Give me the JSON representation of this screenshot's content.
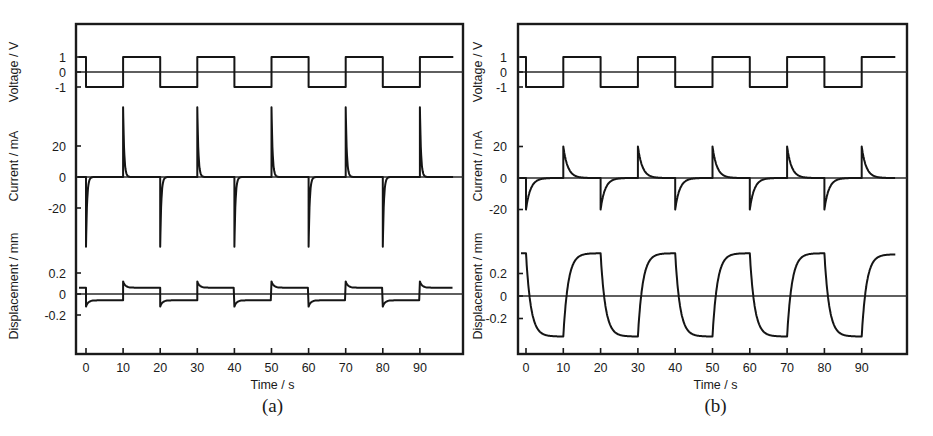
{
  "figure": {
    "panels": [
      {
        "id": "a",
        "caption": "(a)",
        "xlabel": "Time / s",
        "ylabels": [
          "Voltage / V",
          "Current / mA",
          "Displacement / mm"
        ],
        "voltage_ticks": [
          "1",
          "0",
          "-1"
        ],
        "current_ticks": [
          "20",
          "0",
          "-20"
        ],
        "displacement_ticks": [
          "0.2",
          "0",
          "-0.2"
        ],
        "x_ticks": [
          "0",
          "10",
          "20",
          "30",
          "40",
          "50",
          "60",
          "70",
          "80",
          "90"
        ]
      },
      {
        "id": "b",
        "caption": "(b)",
        "xlabel": "Time / s",
        "ylabels": [
          "Voltage / V",
          "Current / mA",
          "Displacement / mm"
        ],
        "voltage_ticks": [
          "1",
          "0",
          "-1"
        ],
        "current_ticks": [
          "20",
          "0",
          "-20"
        ],
        "displacement_ticks": [
          "0.2",
          "0",
          "-0.2"
        ],
        "x_ticks": [
          "0",
          "10",
          "20",
          "30",
          "40",
          "50",
          "60",
          "70",
          "80",
          "90"
        ]
      }
    ]
  },
  "chart_data": [
    {
      "type": "line",
      "panel": "(a)",
      "title": "",
      "xlabel": "Time / s",
      "xlim": [
        -2,
        103
      ],
      "x_ticks": [
        0,
        10,
        20,
        30,
        40,
        50,
        60,
        70,
        80,
        90
      ],
      "grid": false,
      "legend": null,
      "subplots": [
        {
          "ylabel": "Voltage / V",
          "y_ticks": [
            -1,
            0,
            1
          ],
          "description": "square wave, +/-1 V, 20 s period",
          "x": [
            -2,
            0,
            0,
            10,
            10,
            20,
            20,
            30,
            30,
            40,
            40,
            50,
            50,
            60,
            60,
            70,
            70,
            80,
            80,
            90,
            90,
            100
          ],
          "y": [
            1,
            1,
            -1,
            -1,
            1,
            1,
            -1,
            -1,
            1,
            1,
            -1,
            -1,
            1,
            1,
            -1,
            -1,
            1,
            1,
            -1,
            -1,
            1,
            1
          ]
        },
        {
          "ylabel": "Current / mA",
          "y_ticks": [
            -20,
            0,
            20
          ],
          "description": "sharp transient spikes at each voltage switch, fast decay",
          "spike_times": [
            0,
            10,
            20,
            30,
            40,
            50,
            60,
            70,
            80,
            90
          ],
          "spike_peaks": [
            -45,
            45,
            -45,
            45,
            -45,
            45,
            -45,
            45,
            -45,
            45
          ],
          "decay_time_constant_s": 0.3,
          "baseline": 0
        },
        {
          "ylabel": "Displacement / mm",
          "y_ticks": [
            -0.2,
            0,
            0.2
          ],
          "description": "small step response with overshoot, plateau about +/-0.06 mm",
          "switch_times": [
            0,
            10,
            20,
            30,
            40,
            50,
            60,
            70,
            80,
            90
          ],
          "plateau_levels": [
            -0.06,
            0.06,
            -0.06,
            0.06,
            -0.06,
            0.06,
            -0.06,
            0.06,
            -0.06,
            0.06
          ],
          "overshoot_peaks": [
            -0.12,
            0.12,
            -0.12,
            0.12,
            -0.12,
            0.12,
            -0.12,
            0.12,
            -0.12,
            0.12
          ],
          "initial_value": 0.06
        }
      ]
    },
    {
      "type": "line",
      "panel": "(b)",
      "title": "",
      "xlabel": "Time / s",
      "xlim": [
        -2,
        103
      ],
      "x_ticks": [
        0,
        10,
        20,
        30,
        40,
        50,
        60,
        70,
        80,
        90
      ],
      "grid": false,
      "legend": null,
      "subplots": [
        {
          "ylabel": "Voltage / V",
          "y_ticks": [
            -1,
            0,
            1
          ],
          "description": "square wave, +/-1 V, 20 s period",
          "x": [
            -2,
            0,
            0,
            10,
            10,
            20,
            20,
            30,
            30,
            40,
            40,
            50,
            50,
            60,
            60,
            70,
            70,
            80,
            80,
            90,
            90,
            100
          ],
          "y": [
            1,
            1,
            -1,
            -1,
            1,
            1,
            -1,
            -1,
            1,
            1,
            -1,
            -1,
            1,
            1,
            -1,
            -1,
            1,
            1,
            -1,
            -1,
            1,
            1
          ]
        },
        {
          "ylabel": "Current / mA",
          "y_ticks": [
            -20,
            0,
            20
          ],
          "description": "transient peaks about +/-20 mA with slower exponential decay",
          "spike_times": [
            0,
            10,
            20,
            30,
            40,
            50,
            60,
            70,
            80,
            90
          ],
          "spike_peaks": [
            -20,
            20,
            -20,
            20,
            -20,
            20,
            -20,
            20,
            -20,
            20
          ],
          "decay_time_constant_s": 1.2,
          "baseline": 0
        },
        {
          "ylabel": "Displacement / mm",
          "y_ticks": [
            -0.2,
            0,
            0.2
          ],
          "description": "large first-order bending response, saturating plateaus",
          "switch_times": [
            0,
            10,
            20,
            30,
            40,
            50,
            60,
            70,
            80,
            90
          ],
          "plateau_levels": [
            -0.36,
            0.38,
            -0.36,
            0.38,
            -0.36,
            0.38,
            -0.36,
            0.38,
            -0.36,
            0.37
          ],
          "time_constant_s": 1.3,
          "initial_value": 0.38
        }
      ]
    }
  ]
}
